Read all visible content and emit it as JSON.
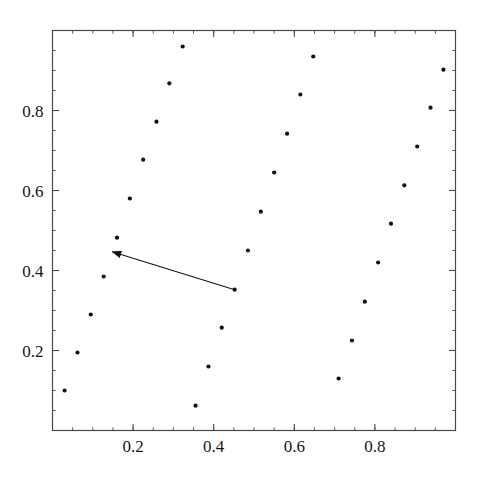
{
  "chart_data": {
    "type": "scatter",
    "title": "",
    "subtitle": "",
    "xlabel": "",
    "ylabel": "",
    "xlim": [
      0.0,
      1.0
    ],
    "ylim": [
      0.0,
      1.0
    ],
    "grid": false,
    "legend": null,
    "frame": true,
    "tick_direction": "in",
    "marker": {
      "shape": "circle",
      "color": "#101010",
      "size_px": 4.2
    },
    "xticks_major": [
      0.2,
      0.4,
      0.6,
      0.8
    ],
    "xtick_labels": [
      "0.2",
      "0.4",
      "0.6",
      "0.8"
    ],
    "yticks_major": [
      0.2,
      0.4,
      0.6,
      0.8
    ],
    "ytick_labels": [
      "0.2",
      "0.4",
      "0.6",
      "0.8"
    ],
    "xticks_minor_step": 0.05,
    "yticks_minor_step": 0.05,
    "series": [
      {
        "name": "points",
        "points": [
          {
            "x": 0.03,
            "y": 0.1
          },
          {
            "x": 0.062,
            "y": 0.195
          },
          {
            "x": 0.095,
            "y": 0.29
          },
          {
            "x": 0.127,
            "y": 0.385
          },
          {
            "x": 0.16,
            "y": 0.482
          },
          {
            "x": 0.192,
            "y": 0.58
          },
          {
            "x": 0.225,
            "y": 0.677
          },
          {
            "x": 0.258,
            "y": 0.772
          },
          {
            "x": 0.29,
            "y": 0.868
          },
          {
            "x": 0.323,
            "y": 0.96
          },
          {
            "x": 0.355,
            "y": 0.062
          },
          {
            "x": 0.387,
            "y": 0.16
          },
          {
            "x": 0.42,
            "y": 0.257
          },
          {
            "x": 0.452,
            "y": 0.352
          },
          {
            "x": 0.485,
            "y": 0.45
          },
          {
            "x": 0.517,
            "y": 0.547
          },
          {
            "x": 0.55,
            "y": 0.645
          },
          {
            "x": 0.582,
            "y": 0.742
          },
          {
            "x": 0.615,
            "y": 0.84
          },
          {
            "x": 0.647,
            "y": 0.935
          },
          {
            "x": 0.71,
            "y": 0.13
          },
          {
            "x": 0.743,
            "y": 0.225
          },
          {
            "x": 0.775,
            "y": 0.322
          },
          {
            "x": 0.808,
            "y": 0.42
          },
          {
            "x": 0.84,
            "y": 0.517
          },
          {
            "x": 0.873,
            "y": 0.613
          },
          {
            "x": 0.905,
            "y": 0.71
          },
          {
            "x": 0.938,
            "y": 0.807
          },
          {
            "x": 0.97,
            "y": 0.902
          }
        ]
      }
    ],
    "annotations": [
      {
        "type": "arrow",
        "tail": {
          "x": 0.452,
          "y": 0.352
        },
        "head": {
          "x": 0.148,
          "y": 0.447
        },
        "color": "#151515"
      }
    ]
  }
}
